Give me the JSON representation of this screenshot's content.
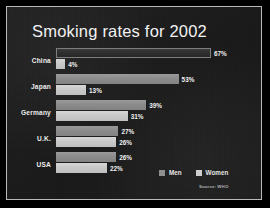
{
  "slide": {
    "title": "Smoking rates for 2002",
    "background_color": "#1d1d1d",
    "border_color": "#b9b9b9",
    "title_color": "#f2f2f2"
  },
  "legend": {
    "position": "bottom-right",
    "items": [
      {
        "label": "Men",
        "color": "#8f8f8f"
      },
      {
        "label": "Women",
        "color": "#cfcfcf"
      }
    ]
  },
  "source_note": "Source: WHO",
  "chart_data": {
    "type": "bar",
    "orientation": "horizontal",
    "title": "Smoking rates for 2002",
    "xlabel": "",
    "ylabel": "",
    "xlim": [
      0,
      67
    ],
    "grid": false,
    "value_suffix": "%",
    "legend_position": "bottom-right",
    "categories": [
      "China",
      "Japan",
      "Germany",
      "U.K.",
      "USA"
    ],
    "series": [
      {
        "name": "Men",
        "color": "#8f8f8f",
        "values": [
          67,
          53,
          39,
          27,
          26
        ],
        "labels": [
          "67%",
          "53%",
          "39%",
          "27%",
          "26%"
        ]
      },
      {
        "name": "Women",
        "color": "#cfcfcf",
        "values": [
          4,
          13,
          31,
          26,
          22
        ],
        "labels": [
          "4%",
          "13%",
          "31%",
          "26%",
          "22%"
        ]
      }
    ]
  }
}
